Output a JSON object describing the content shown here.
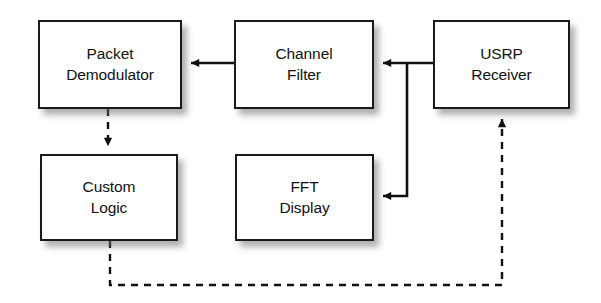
{
  "diagram": {
    "colors": {
      "background": "#ffffff",
      "block_fill": "#ffffff",
      "block_stroke": "#1a1a1a",
      "connector": "#111111",
      "shadow": "#6e6e6e",
      "text": "#111111"
    },
    "blocks": [
      {
        "id": "packet-demodulator",
        "line1": "Packet",
        "line2": "Demodulator",
        "x": 38,
        "y": 20,
        "w": 144,
        "h": 89
      },
      {
        "id": "channel-filter",
        "line1": "Channel",
        "line2": "Filter",
        "x": 234,
        "y": 20,
        "w": 140,
        "h": 89
      },
      {
        "id": "usrp-receiver",
        "line1": "USRP",
        "line2": "Receiver",
        "x": 433,
        "y": 20,
        "w": 137,
        "h": 89
      },
      {
        "id": "custom-logic",
        "line1": "Custom",
        "line2": "Logic",
        "x": 40,
        "y": 154,
        "w": 138,
        "h": 87
      },
      {
        "id": "fft-display",
        "line1": "FFT",
        "line2": "Display",
        "x": 235,
        "y": 154,
        "w": 139,
        "h": 87
      }
    ],
    "connectors": [
      {
        "id": "usrp-to-channel-filter",
        "from": "usrp-receiver",
        "to": "channel-filter",
        "style": "solid",
        "arrow": "end"
      },
      {
        "id": "channel-filter-to-packet-demodulator",
        "from": "channel-filter",
        "to": "packet-demodulator",
        "style": "solid",
        "arrow": "end"
      },
      {
        "id": "usrp-to-fft-display",
        "from": "usrp-receiver",
        "to": "fft-display",
        "style": "solid",
        "arrow": "end"
      },
      {
        "id": "packet-demodulator-to-custom-logic",
        "from": "packet-demodulator",
        "to": "custom-logic",
        "style": "dashed",
        "arrow": "end"
      },
      {
        "id": "custom-logic-to-usrp",
        "from": "custom-logic",
        "to": "usrp-receiver",
        "style": "dashed",
        "arrow": "end"
      }
    ]
  }
}
